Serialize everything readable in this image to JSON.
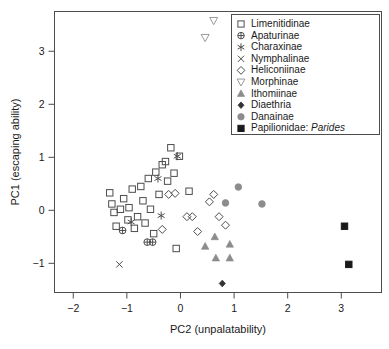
{
  "chart_data": {
    "type": "scatter",
    "title": "",
    "xlabel": "PC2 (unpalatability)",
    "ylabel": "PC1 (escaping ability)",
    "xlim": [
      -2.35,
      3.75
    ],
    "ylim": [
      -1.55,
      3.75
    ],
    "xticks": [
      -2,
      -1,
      0,
      1,
      2,
      3
    ],
    "xtick_labels": [
      "−2",
      "−1",
      "0",
      "1",
      "2",
      "3"
    ],
    "yticks": [
      -1,
      0,
      1,
      2,
      3
    ],
    "ytick_labels": [
      "−1",
      "0",
      "1",
      "2",
      "3"
    ],
    "grid": false,
    "legend_position": "top-right",
    "series": [
      {
        "name": "Limenitidinae",
        "marker": "open-square",
        "color": "#4d4d4d",
        "points": [
          [
            -1.32,
            0.33
          ],
          [
            -1.28,
            0.12
          ],
          [
            -1.24,
            -0.04
          ],
          [
            -1.2,
            -0.3
          ],
          [
            -1.12,
            0.02
          ],
          [
            -1.06,
            0.22
          ],
          [
            -0.98,
            -0.18
          ],
          [
            -0.96,
            0.05
          ],
          [
            -0.9,
            0.4
          ],
          [
            -0.86,
            -0.34
          ],
          [
            -0.8,
            -0.12
          ],
          [
            -0.74,
            0.45
          ],
          [
            -0.7,
            0.18
          ],
          [
            -0.66,
            -0.24
          ],
          [
            -0.6,
            0.6
          ],
          [
            -0.56,
            0.02
          ],
          [
            -0.5,
            -0.44
          ],
          [
            -0.46,
            0.72
          ],
          [
            -0.4,
            0.3
          ],
          [
            -0.34,
            0.86
          ],
          [
            -0.28,
            0.92
          ],
          [
            -0.24,
            0.55
          ],
          [
            -0.18,
            1.18
          ],
          [
            -0.12,
            0.7
          ],
          [
            -0.08,
            -0.72
          ],
          [
            -0.02,
            1.02
          ],
          [
            0.16,
            0.36
          ]
        ]
      },
      {
        "name": "Apaturinae",
        "marker": "circle-plus",
        "color": "#4d4d4d",
        "points": [
          [
            -1.08,
            -0.38
          ],
          [
            -0.62,
            -0.6
          ],
          [
            -0.52,
            -0.6
          ]
        ]
      },
      {
        "name": "Charaxinae",
        "marker": "asterisk",
        "color": "#4d4d4d",
        "points": [
          [
            -0.92,
            -0.22
          ],
          [
            -0.42,
            0.6
          ],
          [
            -0.36,
            -0.1
          ],
          [
            -0.06,
            1.02
          ]
        ]
      },
      {
        "name": "Nymphalinae",
        "marker": "cross",
        "color": "#4d4d4d",
        "points": [
          [
            -1.14,
            -1.02
          ]
        ]
      },
      {
        "name": "Heliconiinae",
        "marker": "open-diamond",
        "color": "#4d4d4d",
        "points": [
          [
            -0.34,
            -0.36
          ],
          [
            -0.22,
            0.3
          ],
          [
            -0.1,
            0.32
          ],
          [
            0.12,
            -0.12
          ],
          [
            0.22,
            -0.12
          ],
          [
            0.32,
            -0.4
          ],
          [
            0.54,
            0.16
          ],
          [
            0.62,
            0.3
          ],
          [
            0.72,
            -0.12
          ],
          [
            0.84,
            -0.28
          ]
        ]
      },
      {
        "name": "Morphinae",
        "marker": "open-triangle-down",
        "color": "#9a9a9a",
        "points": [
          [
            0.62,
            3.58
          ],
          [
            0.46,
            3.26
          ]
        ]
      },
      {
        "name": "Ithomiinae",
        "marker": "filled-triangle-up",
        "color": "#8c8c8c",
        "points": [
          [
            0.64,
            -0.5
          ],
          [
            0.92,
            -0.64
          ],
          [
            0.66,
            -0.9
          ],
          [
            0.92,
            -0.9
          ],
          [
            0.46,
            -0.68
          ]
        ]
      },
      {
        "name": "Diaethria",
        "marker": "filled-diamond",
        "color": "#333333",
        "points": [
          [
            0.78,
            -1.38
          ]
        ]
      },
      {
        "name": "Danainae",
        "marker": "filled-circle",
        "color": "#8c8c8c",
        "points": [
          [
            1.08,
            0.44
          ],
          [
            0.84,
            0.14
          ],
          [
            1.52,
            0.12
          ]
        ]
      },
      {
        "name": "Papilionidae: Parides",
        "marker": "filled-square",
        "color": "#1a1a1a",
        "points": [
          [
            3.06,
            -0.3
          ],
          [
            3.14,
            -1.02
          ]
        ]
      }
    ]
  },
  "legend": {
    "entries": [
      {
        "label": "Limenitidinae",
        "marker": "open-square",
        "italic_suffix": ""
      },
      {
        "label": "Apaturinae",
        "marker": "circle-plus",
        "italic_suffix": ""
      },
      {
        "label": "Charaxinae",
        "marker": "asterisk",
        "italic_suffix": ""
      },
      {
        "label": "Nymphalinae",
        "marker": "cross",
        "italic_suffix": ""
      },
      {
        "label": "Heliconiinae",
        "marker": "open-diamond",
        "italic_suffix": ""
      },
      {
        "label": "Morphinae",
        "marker": "open-triangle-down",
        "italic_suffix": ""
      },
      {
        "label": "Ithomiinae",
        "marker": "filled-triangle-up",
        "italic_suffix": ""
      },
      {
        "label": "Diaethria",
        "marker": "filled-diamond",
        "italic_suffix": ""
      },
      {
        "label": "Danainae",
        "marker": "filled-circle",
        "italic_suffix": ""
      },
      {
        "label": "Papilionidae: ",
        "marker": "filled-square",
        "italic_suffix": "Parides"
      }
    ]
  },
  "colors": {
    "frame": "#4d4d4d",
    "text": "#1a1a1a",
    "marker_dark": "#4d4d4d",
    "marker_grey": "#8c8c8c",
    "marker_black": "#1a1a1a",
    "background": "#ffffff"
  }
}
